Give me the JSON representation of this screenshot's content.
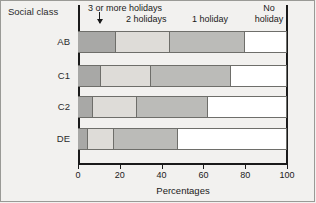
{
  "figure": {
    "background_color": "#f2f1ef",
    "axis_color": "#1a1a1a",
    "social_class_label": "Social class",
    "xaxis_title": "Percentages"
  },
  "annotations": {
    "three_or_more": "3 or more holidays",
    "two_holidays": "2 holidays",
    "one_holiday": "1 holiday",
    "no_holiday_line1": "No",
    "no_holiday_line2": "holiday",
    "arrow": "down-arrow-to-first-segment"
  },
  "chart_data": {
    "type": "bar",
    "orientation": "horizontal",
    "stacked": true,
    "percent_stacked": true,
    "title": "",
    "xlabel": "Percentages",
    "ylabel": "Social class",
    "xlim": [
      0,
      100
    ],
    "xticks": [
      0,
      20,
      40,
      60,
      80,
      100
    ],
    "xticklabels": [
      "0",
      "20",
      "40",
      "60",
      "80",
      "100"
    ],
    "grid": false,
    "legend_position": "top-inline-annotations",
    "categories": [
      "AB",
      "C1",
      "C2",
      "DE"
    ],
    "series": [
      {
        "name": "3 or more holidays",
        "color": "#a8a8a6",
        "values": [
          18,
          11,
          7,
          5
        ]
      },
      {
        "name": "2 holidays",
        "color": "#dedcd8",
        "values": [
          26,
          24,
          21,
          12
        ]
      },
      {
        "name": "1 holiday",
        "color": "#bbbbb8",
        "values": [
          36,
          38,
          34,
          31
        ]
      },
      {
        "name": "No holiday",
        "color": "#ffffff",
        "values": [
          20,
          27,
          38,
          52
        ]
      }
    ],
    "cumulative_boundaries": {
      "AB": [
        18,
        44,
        80,
        100
      ],
      "C1": [
        11,
        35,
        73,
        100
      ],
      "C2": [
        7,
        28,
        62,
        100
      ],
      "DE": [
        5,
        17,
        48,
        100
      ]
    }
  }
}
